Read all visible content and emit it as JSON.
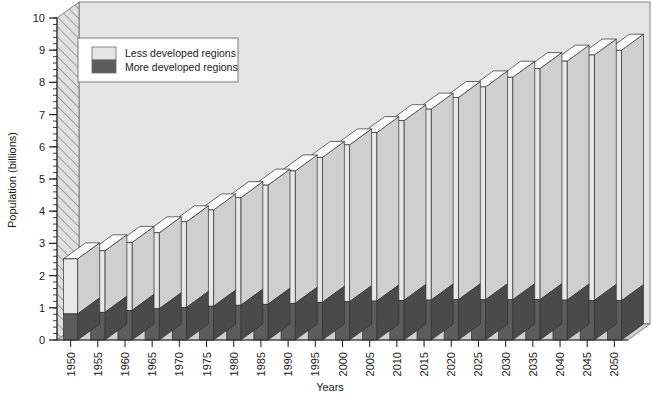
{
  "chart_data": {
    "type": "bar",
    "subtype": "stacked-3d-column",
    "title": "",
    "xlabel": "Years",
    "ylabel": "Population (billions)",
    "categories": [
      "1950",
      "1955",
      "1960",
      "1965",
      "1970",
      "1975",
      "1980",
      "1985",
      "1990",
      "1995",
      "2000",
      "2005",
      "2010",
      "2015",
      "2020",
      "2025",
      "2030",
      "2035",
      "2040",
      "2045",
      "2050"
    ],
    "series": [
      {
        "name": "More developed regions",
        "color": "#5c5c5c",
        "values": [
          0.81,
          0.86,
          0.92,
          0.97,
          1.01,
          1.05,
          1.08,
          1.11,
          1.14,
          1.17,
          1.19,
          1.21,
          1.23,
          1.24,
          1.25,
          1.25,
          1.25,
          1.25,
          1.24,
          1.23,
          1.22
        ]
      },
      {
        "name": "Less developed regions",
        "color": "#e6e6e6",
        "values": [
          1.71,
          1.91,
          2.11,
          2.36,
          2.66,
          2.99,
          3.34,
          3.7,
          4.11,
          4.5,
          4.87,
          5.23,
          5.58,
          5.93,
          6.28,
          6.61,
          6.91,
          7.18,
          7.42,
          7.62,
          7.78
        ]
      }
    ],
    "totals": [
      2.52,
      2.77,
      3.03,
      3.33,
      3.67,
      4.04,
      4.42,
      4.81,
      5.25,
      5.67,
      6.06,
      6.44,
      6.81,
      7.17,
      7.53,
      7.86,
      8.16,
      8.43,
      8.66,
      8.85,
      9.0
    ],
    "ylim": [
      0,
      10
    ],
    "yticks": [
      0,
      1,
      2,
      3,
      4,
      5,
      6,
      7,
      8,
      9,
      10
    ],
    "ytick_labels": [
      "0",
      "1",
      "2",
      "3",
      "4",
      "5",
      "6",
      "7",
      "8",
      "9",
      "10"
    ],
    "minor_tick_interval": 0.2,
    "grid": false,
    "legend": {
      "position": "top-left-inside",
      "entries": [
        {
          "label": "Less developed regions",
          "color": "#e6e6e6"
        },
        {
          "label": "More developed regions",
          "color": "#5c5c5c"
        }
      ]
    },
    "colors": {
      "plot_background": "#e4e4e4",
      "floor": "#d0d0d0",
      "bar_front_light": "#e8e8e8",
      "bar_side_light": "#cfcfcf",
      "bar_top": "#fcfcfc",
      "bar_front_dark": "#5c5c5c",
      "bar_side_dark": "#4a4a4a",
      "axis": "#2a2a2a",
      "wall_hatch": "#9a9a9a"
    },
    "xlabel_rotation": -90
  }
}
